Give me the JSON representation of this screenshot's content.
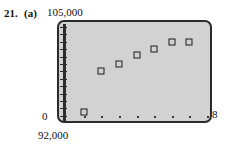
{
  "problem": {
    "number": "21.",
    "part": "(a)"
  },
  "labels": {
    "y_max": "105,000",
    "y_min": "92,000",
    "y_zero": "0",
    "x_max": "8"
  },
  "colors": {
    "screen_fill": "#d2d2d2",
    "frame": "#2b2b2b",
    "marker": "#1a1a1a",
    "text": "#111111"
  },
  "chart_data": {
    "type": "scatter",
    "title": "",
    "xlabel": "",
    "ylabel": "",
    "xlim": [
      0,
      8
    ],
    "ylim": [
      92000,
      105000
    ],
    "grid": false,
    "legend": null,
    "ytick_count": 13,
    "xtick_count": 8,
    "marker_style": "open-square",
    "x": [
      1,
      2,
      3,
      4,
      5,
      6,
      7
    ],
    "y": [
      92700,
      98700,
      99700,
      101000,
      101900,
      103000,
      103000
    ],
    "points": [
      {
        "x": 1,
        "y": 92700
      },
      {
        "x": 2,
        "y": 98700
      },
      {
        "x": 3,
        "y": 99700
      },
      {
        "x": 4,
        "y": 101000
      },
      {
        "x": 5,
        "y": 101900
      },
      {
        "x": 6,
        "y": 103000
      },
      {
        "x": 7,
        "y": 103000
      }
    ]
  }
}
